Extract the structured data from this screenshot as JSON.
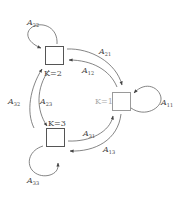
{
  "diagram": {
    "type": "state-transition",
    "states": [
      {
        "id": "1",
        "label": "K=1"
      },
      {
        "id": "2",
        "label": "K=2"
      },
      {
        "id": "3",
        "label": "K=3"
      }
    ],
    "edges": [
      {
        "from": "1",
        "to": "1",
        "label": "A",
        "sub": "11"
      },
      {
        "from": "2",
        "to": "2",
        "label": "A",
        "sub": "22"
      },
      {
        "from": "3",
        "to": "3",
        "label": "A",
        "sub": "33"
      },
      {
        "from": "2",
        "to": "1",
        "label": "A",
        "sub": "21"
      },
      {
        "from": "1",
        "to": "2",
        "label": "A",
        "sub": "12"
      },
      {
        "from": "3",
        "to": "1",
        "label": "A",
        "sub": "31"
      },
      {
        "from": "1",
        "to": "3",
        "label": "A",
        "sub": "13"
      },
      {
        "from": "3",
        "to": "2",
        "label": "A",
        "sub": "32"
      },
      {
        "from": "2",
        "to": "3",
        "label": "A",
        "sub": "23"
      }
    ]
  }
}
